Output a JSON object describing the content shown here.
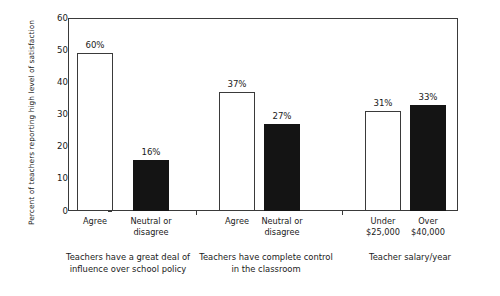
{
  "chart_data": {
    "type": "bar",
    "title": "",
    "xlabel": "",
    "ylabel": "Percent of teachers reporting high level of satisfaction",
    "ylim": [
      0,
      60
    ],
    "yticks": [
      0,
      10,
      20,
      30,
      40,
      50,
      60
    ],
    "grid": false,
    "legend": "none",
    "note": "Bars are grouped in three pairs; open (white) bars are the first item of each pair, solid (black) bars the second. The first bar is labelled 60% but is drawn to a height of about 49 on the axis.",
    "groups": [
      {
        "caption": "Teachers have a great deal of influence over school policy",
        "bars": [
          {
            "category": "Agree",
            "label": "60%",
            "value": 60,
            "drawn_value": 49,
            "style": "open"
          },
          {
            "category": "Neutral or disagree",
            "label": "16%",
            "value": 16,
            "drawn_value": 16,
            "style": "filled"
          }
        ]
      },
      {
        "caption": "Teachers have complete control in the classroom",
        "bars": [
          {
            "category": "Agree",
            "label": "37%",
            "value": 37,
            "drawn_value": 37,
            "style": "open"
          },
          {
            "category": "Neutral or disagree",
            "label": "27%",
            "value": 27,
            "drawn_value": 27,
            "style": "filled"
          }
        ]
      },
      {
        "caption": "Teacher salary/year",
        "bars": [
          {
            "category": "Under $25,000",
            "label": "31%",
            "value": 31,
            "drawn_value": 31,
            "style": "open"
          },
          {
            "category": "Over $40,000",
            "label": "33%",
            "value": 33,
            "drawn_value": 33,
            "style": "filled"
          }
        ]
      }
    ],
    "colors": {
      "open_bar_fill": "#ffffff",
      "open_bar_stroke": "#3a3a3a",
      "filled_bar": "#141414",
      "axis": "#3a3a3a",
      "text": "#1a1a1a",
      "background": "#ffffff"
    }
  }
}
